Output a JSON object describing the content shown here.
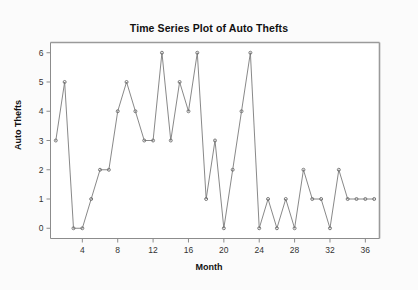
{
  "chart_data": {
    "type": "line",
    "title": "Time Series Plot of Auto Thefts",
    "xlabel": "Month",
    "ylabel": "Auto Thefts",
    "x": [
      1,
      2,
      3,
      4,
      5,
      6,
      7,
      8,
      9,
      10,
      11,
      12,
      13,
      14,
      15,
      16,
      17,
      18,
      19,
      20,
      21,
      22,
      23,
      24,
      25,
      26,
      27,
      28,
      29,
      30,
      31,
      32,
      33,
      34,
      35,
      36,
      37
    ],
    "values": [
      3,
      5,
      0,
      0,
      1,
      2,
      2,
      4,
      5,
      4,
      3,
      3,
      6,
      3,
      5,
      4,
      6,
      1,
      3,
      0,
      2,
      4,
      6,
      0,
      1,
      0,
      1,
      0,
      2,
      1,
      1,
      0,
      2,
      1,
      1,
      1,
      1
    ],
    "series": [
      {
        "name": "Auto Thefts",
        "values": [
          3,
          5,
          0,
          0,
          1,
          2,
          2,
          4,
          5,
          4,
          3,
          3,
          6,
          3,
          5,
          4,
          6,
          1,
          3,
          0,
          2,
          4,
          6,
          0,
          1,
          0,
          1,
          0,
          2,
          1,
          1,
          0,
          2,
          1,
          1,
          1,
          1
        ]
      }
    ],
    "xlim": [
      0.4,
      37.6
    ],
    "ylim": [
      -0.35,
      6.35
    ],
    "xticks": [
      4,
      8,
      12,
      16,
      20,
      24,
      28,
      32,
      36
    ],
    "xtick_labels": [
      "4",
      "8",
      "12",
      "16",
      "20",
      "24",
      "28",
      "32",
      "36"
    ],
    "yticks": [
      0,
      1,
      2,
      3,
      4,
      5,
      6
    ],
    "ytick_labels": [
      "0",
      "1",
      "2",
      "3",
      "4",
      "5",
      "6"
    ],
    "grid": false,
    "legend": false,
    "legend_position": "none",
    "marker": "circle",
    "line_color": "#7a7a7a",
    "marker_color": "#6d6d6d",
    "axis_color": "#8c8c8c",
    "frame_top_color": "#9a9a9a",
    "frame_right_color": "#9a9a9a",
    "background_color": "#fbfbfb",
    "plot_background_color": "#ffffff"
  }
}
